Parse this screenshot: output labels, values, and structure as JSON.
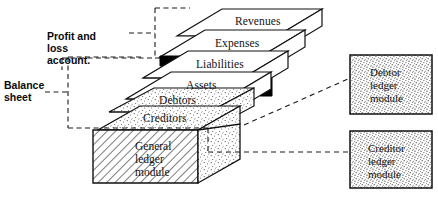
{
  "diagram": {
    "brackets": [
      {
        "id": "profit-loss",
        "label": "Profit and\nloss\naccount."
      },
      {
        "id": "balance-sheet",
        "label": "Balance\nsheet"
      }
    ],
    "slabs": [
      {
        "id": "revenues",
        "label": "Revenues",
        "fill": "plain"
      },
      {
        "id": "expenses",
        "label": "Expenses",
        "fill": "plain"
      },
      {
        "id": "liabilities",
        "label": "Liabilities",
        "fill": "plain"
      },
      {
        "id": "assets",
        "label": "Assets",
        "fill": "plain"
      },
      {
        "id": "debtors",
        "label": "Debtors",
        "fill": "stipple"
      },
      {
        "id": "creditors",
        "label": "Creditors",
        "fill": "stipple"
      }
    ],
    "base_block": {
      "id": "general-ledger",
      "label": "General\nledger\nmodule",
      "fill": "hatch"
    },
    "modules": [
      {
        "id": "debtor-ledger",
        "label": "Debtor\nledger\nmodule",
        "fill": "stipple"
      },
      {
        "id": "creditor-ledger",
        "label": "Creditor\nledger\nmodule",
        "fill": "stipple"
      }
    ],
    "colors": {
      "ink": "#111111",
      "paper": "#ffffff",
      "divider": "#000000",
      "dash": "#1a1a1a"
    }
  }
}
